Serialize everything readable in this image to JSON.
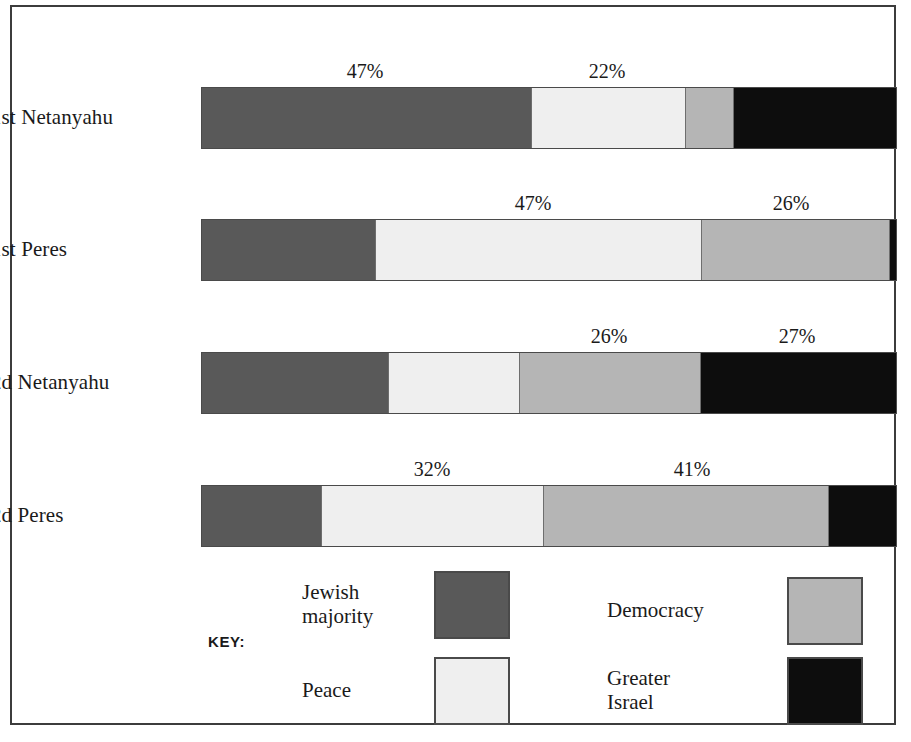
{
  "chart_data": {
    "type": "bar",
    "orientation": "horizontal",
    "stacked": true,
    "title": "",
    "xlabel": "",
    "ylabel": "",
    "xlim": [
      0,
      100
    ],
    "grid": false,
    "legend_position": "bottom",
    "categories": [
      "1st Netanyahu",
      "1st Peres",
      "2d Netanyahu",
      "2d Peres"
    ],
    "series": [
      {
        "name": "Jewish majority",
        "color": "#595959",
        "values": [
          47,
          25,
          27,
          17
        ]
      },
      {
        "name": "Peace",
        "color": "#efefef",
        "values": [
          22,
          47,
          19,
          32
        ]
      },
      {
        "name": "Democracy",
        "color": "#b5b5b5",
        "values": [
          7,
          26,
          26,
          41
        ]
      },
      {
        "name": "Greater Israel",
        "color": "#0d0d0d",
        "values": [
          24,
          2,
          28,
          10
        ]
      }
    ],
    "data_labels": [
      {
        "row": "1st Netanyahu",
        "series": "Jewish majority",
        "text": "47%"
      },
      {
        "row": "1st Netanyahu",
        "series": "Peace",
        "text": "22%"
      },
      {
        "row": "1st Peres",
        "series": "Peace",
        "text": "47%"
      },
      {
        "row": "1st Peres",
        "series": "Democracy",
        "text": "26%"
      },
      {
        "row": "2d Netanyahu",
        "series": "Democracy",
        "text": "26%"
      },
      {
        "row": "2d Netanyahu",
        "series": "Greater Israel",
        "text": "27%"
      },
      {
        "row": "2d Peres",
        "series": "Peace",
        "text": "32%"
      },
      {
        "row": "2d Peres",
        "series": "Democracy",
        "text": "41%"
      }
    ]
  },
  "rows": [
    {
      "label": "1st Netanyahu",
      "top": 80,
      "segments": [
        {
          "series": "Jewish majority",
          "pct": 47,
          "width_px": 329,
          "color": "#595959"
        },
        {
          "series": "Peace",
          "pct": 22,
          "width_px": 154,
          "color": "#efefef"
        },
        {
          "series": "Democracy",
          "pct": 7,
          "width_px": 48,
          "color": "#b5b5b5"
        },
        {
          "series": "Greater Israel",
          "pct": 24,
          "width_px": 163,
          "color": "#0d0d0d"
        }
      ],
      "labels": [
        {
          "text": "47%",
          "x": 363
        },
        {
          "text": "22%",
          "x": 605
        }
      ]
    },
    {
      "label": "1st Peres",
      "top": 212,
      "segments": [
        {
          "series": "Jewish majority",
          "pct": 25,
          "width_px": 173,
          "color": "#595959"
        },
        {
          "series": "Peace",
          "pct": 47,
          "width_px": 326,
          "color": "#efefef"
        },
        {
          "series": "Democracy",
          "pct": 26,
          "width_px": 188,
          "color": "#b5b5b5"
        },
        {
          "series": "Greater Israel",
          "pct": 2,
          "width_px": 7,
          "color": "#0d0d0d"
        }
      ],
      "labels": [
        {
          "text": "47%",
          "x": 531
        },
        {
          "text": "26%",
          "x": 789
        }
      ]
    },
    {
      "label": "2d Netanyahu",
      "top": 345,
      "segments": [
        {
          "series": "Jewish majority",
          "pct": 27,
          "width_px": 186,
          "color": "#595959"
        },
        {
          "series": "Peace",
          "pct": 19,
          "width_px": 131,
          "color": "#efefef"
        },
        {
          "series": "Democracy",
          "pct": 26,
          "width_px": 181,
          "color": "#b5b5b5"
        },
        {
          "series": "Greater Israel",
          "pct": 28,
          "width_px": 196,
          "color": "#0d0d0d"
        }
      ],
      "labels": [
        {
          "text": "26%",
          "x": 607
        },
        {
          "text": "27%",
          "x": 795
        }
      ]
    },
    {
      "label": "2d Peres",
      "top": 478,
      "segments": [
        {
          "series": "Jewish majority",
          "pct": 17,
          "width_px": 119,
          "color": "#595959"
        },
        {
          "series": "Peace",
          "pct": 32,
          "width_px": 222,
          "color": "#efefef"
        },
        {
          "series": "Democracy",
          "pct": 41,
          "width_px": 285,
          "color": "#b5b5b5"
        },
        {
          "series": "Greater Israel",
          "pct": 10,
          "width_px": 68,
          "color": "#0d0d0d"
        }
      ],
      "labels": [
        {
          "text": "32%",
          "x": 430
        },
        {
          "text": "41%",
          "x": 690
        }
      ]
    }
  ],
  "legend": {
    "key_label": "KEY:",
    "entries": [
      {
        "name": "jewish-majority",
        "text": "Jewish\nmajority",
        "color": "#595959"
      },
      {
        "name": "peace",
        "text": "Peace",
        "color": "#efefef"
      },
      {
        "name": "democracy",
        "text": "Democracy",
        "color": "#b5b5b5"
      },
      {
        "name": "greater-israel",
        "text": "Greater\nIsrael",
        "color": "#0d0d0d"
      }
    ]
  }
}
